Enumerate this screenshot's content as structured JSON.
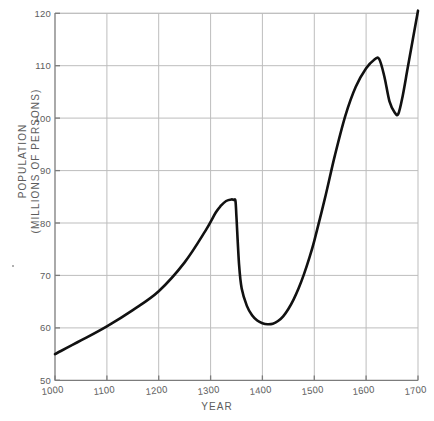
{
  "chart_data": {
    "type": "line",
    "title": "",
    "xlabel": "YEAR",
    "ylabel_lines": [
      "POPULATION",
      "(MILLIONS OF PERSONS)"
    ],
    "ylabel": "POPULATION (MILLIONS OF PERSONS)",
    "xlim": [
      1000,
      1700
    ],
    "ylim": [
      50,
      120
    ],
    "grid": true,
    "legend": "none",
    "xticks": [
      "1000",
      "1100",
      "1200",
      "1300",
      "1400",
      "1500",
      "1600",
      "1700"
    ],
    "yticks": [
      "50",
      "60",
      "70",
      "80",
      "90",
      "100",
      "110",
      "120"
    ],
    "series": [
      {
        "name": "Population",
        "x": [
          1000,
          1050,
          1100,
          1150,
          1200,
          1250,
          1290,
          1310,
          1320,
          1330,
          1340,
          1345,
          1348,
          1350,
          1355,
          1360,
          1370,
          1380,
          1390,
          1400,
          1410,
          1420,
          1430,
          1440,
          1450,
          1460,
          1470,
          1480,
          1490,
          1500,
          1520,
          1540,
          1560,
          1580,
          1600,
          1615,
          1625,
          1635,
          1645,
          1655,
          1662,
          1670,
          1680,
          1690,
          1700
        ],
        "y": [
          55.0,
          57.6,
          60.3,
          63.4,
          67.0,
          72.5,
          78.5,
          82.0,
          83.3,
          84.2,
          84.5,
          84.4,
          84.2,
          81.0,
          72.0,
          67.5,
          64.2,
          62.4,
          61.4,
          60.9,
          60.7,
          60.8,
          61.3,
          62.2,
          63.6,
          65.4,
          67.6,
          70.2,
          73.2,
          76.6,
          84.5,
          93.0,
          100.5,
          106.0,
          109.5,
          111.1,
          111.3,
          108.0,
          103.2,
          101.1,
          100.8,
          104.0,
          109.5,
          115.0,
          120.5
        ]
      }
    ],
    "annotations": {
      "peak_1348": {
        "year": 1348,
        "value": 84.5
      },
      "trough_1410": {
        "year": 1410,
        "value": 60.7
      },
      "peak_1625": {
        "year": 1625,
        "value": 111.3
      },
      "dip_1662": {
        "year": 1662,
        "value": 100.8
      }
    },
    "colors": {
      "line": "#111111",
      "grid": "#bdbdbd",
      "axis": "#7c7c7c",
      "text": "#5d5d5d",
      "background": "#ffffff"
    }
  }
}
